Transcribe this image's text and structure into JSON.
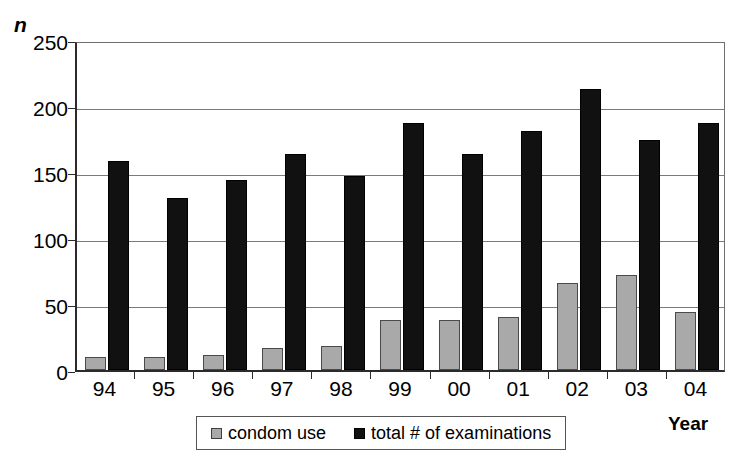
{
  "chart_data": {
    "type": "bar",
    "title": "",
    "subtitle": "",
    "xlabel": "Year",
    "ylabel": "n",
    "categories": [
      "94",
      "95",
      "96",
      "97",
      "98",
      "99",
      "00",
      "01",
      "02",
      "03",
      "04"
    ],
    "series": [
      {
        "name": "condom use",
        "color": "#a9a9a9",
        "values": [
          10,
          10,
          11,
          17,
          18,
          38,
          38,
          40,
          66,
          72,
          44
        ]
      },
      {
        "name": "total # of examinations",
        "color": "#111111",
        "values": [
          158,
          130,
          144,
          164,
          147,
          187,
          164,
          181,
          213,
          174,
          187
        ]
      }
    ],
    "ylim": [
      0,
      250
    ],
    "yticks": [
      0,
      50,
      100,
      150,
      200,
      250
    ],
    "ytick_labels": [
      "0",
      "50",
      "100",
      "150",
      "200",
      "250"
    ],
    "grid": true,
    "grid_axis": "y",
    "legend_position": "bottom-center",
    "legend_entries": [
      "condom use",
      "total # of examinations"
    ]
  },
  "axes": {
    "y_title": "n",
    "x_title": "Year"
  },
  "legend": {
    "items": [
      {
        "label": "condom use",
        "swatch": "gray-square-icon"
      },
      {
        "label": "total # of examinations",
        "swatch": "black-square-icon"
      }
    ]
  }
}
